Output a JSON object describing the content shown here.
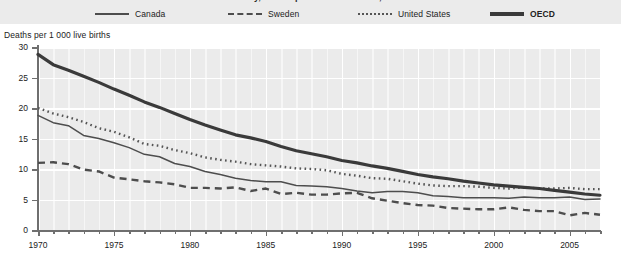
{
  "chart_data": {
    "type": "line",
    "title": "Infant mortality, deaths per 1 000 live births, 1970-2007",
    "xlabel": "",
    "ylabel": "Deaths per 1 000 live births",
    "xlim": [
      1970,
      2007
    ],
    "ylim": [
      0,
      30
    ],
    "yticks": [
      0,
      5,
      10,
      15,
      20,
      25,
      30
    ],
    "xticks": [
      1970,
      1975,
      1980,
      1985,
      1990,
      1995,
      2000,
      2005
    ],
    "xtick_labels": [
      "1970",
      "1975",
      "1980",
      "1985",
      "1990",
      "1995",
      "2000",
      "2005"
    ],
    "ytick_labels": [
      "0",
      "5",
      "10",
      "15",
      "20",
      "25",
      "30"
    ],
    "grid": true,
    "legend_position": "top",
    "x": [
      1970,
      1971,
      1972,
      1973,
      1974,
      1975,
      1976,
      1977,
      1978,
      1979,
      1980,
      1981,
      1982,
      1983,
      1984,
      1985,
      1986,
      1987,
      1988,
      1989,
      1990,
      1991,
      1992,
      1993,
      1994,
      1995,
      1996,
      1997,
      1998,
      1999,
      2000,
      2001,
      2002,
      2003,
      2004,
      2005,
      2006,
      2007
    ],
    "series": [
      {
        "name": "Canada",
        "style": "solid-thin",
        "color": "#4d4d4d",
        "values": [
          18.8,
          17.6,
          17.1,
          15.5,
          15.0,
          14.3,
          13.5,
          12.4,
          12.0,
          10.9,
          10.4,
          9.6,
          9.1,
          8.5,
          8.1,
          7.9,
          7.9,
          7.3,
          7.2,
          7.1,
          6.8,
          6.4,
          6.1,
          6.3,
          6.3,
          6.1,
          5.6,
          5.5,
          5.3,
          5.3,
          5.3,
          5.2,
          5.4,
          5.3,
          5.3,
          5.4,
          5.0,
          5.1
        ]
      },
      {
        "name": "Sweden",
        "style": "dashed",
        "color": "#4d4d4d",
        "values": [
          11.0,
          11.1,
          10.8,
          9.9,
          9.6,
          8.6,
          8.3,
          8.0,
          7.8,
          7.5,
          6.9,
          6.9,
          6.8,
          7.0,
          6.4,
          6.8,
          5.9,
          6.1,
          5.8,
          5.8,
          6.0,
          6.1,
          5.2,
          4.8,
          4.4,
          4.1,
          4.0,
          3.6,
          3.5,
          3.4,
          3.4,
          3.7,
          3.3,
          3.1,
          3.1,
          2.4,
          2.8,
          2.5
        ]
      },
      {
        "name": "United States",
        "style": "dotted",
        "color": "#555555",
        "values": [
          20.0,
          19.1,
          18.5,
          17.7,
          16.7,
          16.1,
          15.2,
          14.1,
          13.8,
          13.1,
          12.6,
          11.9,
          11.5,
          11.2,
          10.8,
          10.6,
          10.4,
          10.1,
          10.0,
          9.8,
          9.2,
          8.9,
          8.5,
          8.4,
          8.0,
          7.6,
          7.3,
          7.2,
          7.2,
          7.1,
          6.9,
          6.8,
          7.0,
          6.8,
          6.8,
          6.9,
          6.7,
          6.7
        ]
      },
      {
        "name": "OECD",
        "style": "solid-thick",
        "color": "#3a3a3a",
        "values": [
          28.8,
          27.1,
          26.2,
          25.2,
          24.2,
          23.1,
          22.1,
          21.0,
          20.1,
          19.1,
          18.1,
          17.2,
          16.4,
          15.6,
          15.1,
          14.5,
          13.7,
          13.0,
          12.5,
          12.0,
          11.4,
          11.0,
          10.5,
          10.1,
          9.6,
          9.1,
          8.7,
          8.4,
          8.0,
          7.7,
          7.4,
          7.2,
          7.0,
          6.8,
          6.5,
          6.2,
          5.9,
          5.7
        ]
      }
    ]
  },
  "legend": {
    "items": [
      {
        "label": "Canada",
        "style": "solid-thin",
        "bold": false
      },
      {
        "label": "Sweden",
        "style": "dashed",
        "bold": false
      },
      {
        "label": "United States",
        "style": "dotted",
        "bold": false
      },
      {
        "label": "OECD",
        "style": "solid-thick",
        "bold": true
      }
    ]
  },
  "colors": {
    "plot_background": "#ebebeb",
    "gridline": "#ffffff",
    "axis": "#6f6f6f",
    "text": "#222222"
  }
}
